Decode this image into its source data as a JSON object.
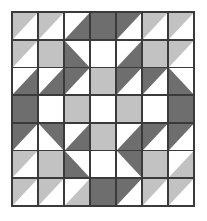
{
  "figure": {
    "rows": 7,
    "columns": 7,
    "palette": {
      "dark": "#6e6e6e",
      "light": "#c2c2c2",
      "white": "#ffffff",
      "seam": "#3a3a3a",
      "background": "#ffffff"
    },
    "cells": [
      [
        {
          "name": "r1c1",
          "kind": "triangle",
          "corner": "upper-left",
          "fill": "#c2c2c2",
          "back": "#ffffff"
        },
        {
          "name": "r1c2",
          "kind": "triangle",
          "corner": "upper-left",
          "fill": "#c2c2c2",
          "back": "#ffffff"
        },
        {
          "name": "r1c3",
          "kind": "triangle",
          "corner": "lower-right",
          "fill": "#6e6e6e",
          "back": "#ffffff"
        },
        {
          "name": "r1c4",
          "kind": "solid",
          "corner": "none",
          "fill": "#6e6e6e",
          "back": "#6e6e6e"
        },
        {
          "name": "r1c5",
          "kind": "triangle",
          "corner": "upper-left",
          "fill": "#6e6e6e",
          "back": "#ffffff"
        },
        {
          "name": "r1c6",
          "kind": "triangle",
          "corner": "upper-left",
          "fill": "#c2c2c2",
          "back": "#ffffff"
        },
        {
          "name": "r1c7",
          "kind": "triangle",
          "corner": "upper-left",
          "fill": "#c2c2c2",
          "back": "#ffffff"
        }
      ],
      [
        {
          "name": "r2c1",
          "kind": "triangle",
          "corner": "upper-left",
          "fill": "#c2c2c2",
          "back": "#ffffff"
        },
        {
          "name": "r2c2",
          "kind": "solid",
          "corner": "none",
          "fill": "#c2c2c2",
          "back": "#c2c2c2"
        },
        {
          "name": "r2c3",
          "kind": "triangle",
          "corner": "lower-left",
          "fill": "#6e6e6e",
          "back": "#ffffff"
        },
        {
          "name": "r2c4",
          "kind": "solid",
          "corner": "none",
          "fill": "#ffffff",
          "back": "#ffffff"
        },
        {
          "name": "r2c5",
          "kind": "triangle",
          "corner": "lower-right",
          "fill": "#6e6e6e",
          "back": "#ffffff"
        },
        {
          "name": "r2c6",
          "kind": "solid",
          "corner": "none",
          "fill": "#c2c2c2",
          "back": "#c2c2c2"
        },
        {
          "name": "r2c7",
          "kind": "triangle",
          "corner": "upper-left",
          "fill": "#c2c2c2",
          "back": "#ffffff"
        }
      ],
      [
        {
          "name": "r3c1",
          "kind": "triangle",
          "corner": "lower-right",
          "fill": "#6e6e6e",
          "back": "#ffffff"
        },
        {
          "name": "r3c2",
          "kind": "triangle",
          "corner": "lower-right",
          "fill": "#6e6e6e",
          "back": "#ffffff"
        },
        {
          "name": "r3c3",
          "kind": "triangle",
          "corner": "upper-left",
          "fill": "#6e6e6e",
          "back": "#ffffff"
        },
        {
          "name": "r3c4",
          "kind": "solid",
          "corner": "none",
          "fill": "#c2c2c2",
          "back": "#c2c2c2"
        },
        {
          "name": "r3c5",
          "kind": "triangle",
          "corner": "upper-left",
          "fill": "#6e6e6e",
          "back": "#ffffff"
        },
        {
          "name": "r3c6",
          "kind": "triangle",
          "corner": "upper-left",
          "fill": "#6e6e6e",
          "back": "#ffffff"
        },
        {
          "name": "r3c7",
          "kind": "triangle",
          "corner": "lower-left",
          "fill": "#6e6e6e",
          "back": "#ffffff"
        }
      ],
      [
        {
          "name": "r4c1",
          "kind": "solid",
          "corner": "none",
          "fill": "#6e6e6e",
          "back": "#6e6e6e"
        },
        {
          "name": "r4c2",
          "kind": "solid",
          "corner": "none",
          "fill": "#ffffff",
          "back": "#ffffff"
        },
        {
          "name": "r4c3",
          "kind": "solid",
          "corner": "none",
          "fill": "#c2c2c2",
          "back": "#c2c2c2"
        },
        {
          "name": "r4c4",
          "kind": "solid",
          "corner": "none",
          "fill": "#ffffff",
          "back": "#ffffff"
        },
        {
          "name": "r4c5",
          "kind": "solid",
          "corner": "none",
          "fill": "#c2c2c2",
          "back": "#c2c2c2"
        },
        {
          "name": "r4c6",
          "kind": "solid",
          "corner": "none",
          "fill": "#ffffff",
          "back": "#ffffff"
        },
        {
          "name": "r4c7",
          "kind": "solid",
          "corner": "none",
          "fill": "#6e6e6e",
          "back": "#6e6e6e"
        }
      ],
      [
        {
          "name": "r5c1",
          "kind": "triangle",
          "corner": "upper-left",
          "fill": "#6e6e6e",
          "back": "#ffffff"
        },
        {
          "name": "r5c2",
          "kind": "triangle",
          "corner": "upper-right",
          "fill": "#6e6e6e",
          "back": "#ffffff"
        },
        {
          "name": "r5c3",
          "kind": "triangle",
          "corner": "lower-right",
          "fill": "#6e6e6e",
          "back": "#ffffff"
        },
        {
          "name": "r5c4",
          "kind": "solid",
          "corner": "none",
          "fill": "#c2c2c2",
          "back": "#c2c2c2"
        },
        {
          "name": "r5c5",
          "kind": "triangle",
          "corner": "lower-right",
          "fill": "#6e6e6e",
          "back": "#ffffff"
        },
        {
          "name": "r5c6",
          "kind": "triangle",
          "corner": "upper-left",
          "fill": "#6e6e6e",
          "back": "#ffffff"
        },
        {
          "name": "r5c7",
          "kind": "triangle",
          "corner": "upper-left",
          "fill": "#6e6e6e",
          "back": "#ffffff"
        }
      ],
      [
        {
          "name": "r6c1",
          "kind": "triangle",
          "corner": "upper-left",
          "fill": "#c2c2c2",
          "back": "#ffffff"
        },
        {
          "name": "r6c2",
          "kind": "solid",
          "corner": "none",
          "fill": "#c2c2c2",
          "back": "#c2c2c2"
        },
        {
          "name": "r6c3",
          "kind": "triangle",
          "corner": "lower-left",
          "fill": "#6e6e6e",
          "back": "#ffffff"
        },
        {
          "name": "r6c4",
          "kind": "solid",
          "corner": "none",
          "fill": "#ffffff",
          "back": "#ffffff"
        },
        {
          "name": "r6c5",
          "kind": "triangle",
          "corner": "upper-right",
          "fill": "#6e6e6e",
          "back": "#ffffff"
        },
        {
          "name": "r6c6",
          "kind": "solid",
          "corner": "none",
          "fill": "#c2c2c2",
          "back": "#c2c2c2"
        },
        {
          "name": "r6c7",
          "kind": "triangle",
          "corner": "lower-right",
          "fill": "#c2c2c2",
          "back": "#ffffff"
        }
      ],
      [
        {
          "name": "r7c1",
          "kind": "triangle",
          "corner": "upper-left",
          "fill": "#c2c2c2",
          "back": "#ffffff"
        },
        {
          "name": "r7c2",
          "kind": "triangle",
          "corner": "upper-left",
          "fill": "#c2c2c2",
          "back": "#ffffff"
        },
        {
          "name": "r7c3",
          "kind": "triangle",
          "corner": "lower-right",
          "fill": "#c2c2c2",
          "back": "#ffffff"
        },
        {
          "name": "r7c4",
          "kind": "solid",
          "corner": "none",
          "fill": "#6e6e6e",
          "back": "#6e6e6e"
        },
        {
          "name": "r7c5",
          "kind": "triangle",
          "corner": "upper-left",
          "fill": "#6e6e6e",
          "back": "#ffffff"
        },
        {
          "name": "r7c6",
          "kind": "triangle",
          "corner": "upper-left",
          "fill": "#c2c2c2",
          "back": "#ffffff"
        },
        {
          "name": "r7c7",
          "kind": "triangle",
          "corner": "upper-left",
          "fill": "#c2c2c2",
          "back": "#ffffff"
        }
      ]
    ]
  }
}
